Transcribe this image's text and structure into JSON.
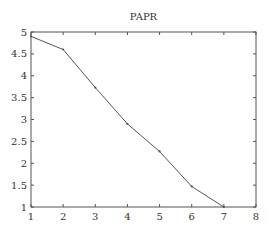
{
  "chart_data": {
    "type": "line",
    "title": "PAPR",
    "xlabel": "",
    "ylabel": "",
    "x": [
      1,
      2,
      3,
      4,
      5,
      6,
      7
    ],
    "series": [
      {
        "name": "PAPR",
        "values": [
          4.9,
          4.6,
          3.73,
          2.9,
          2.27,
          1.47,
          1.0
        ],
        "color": "#555555",
        "marker": "dot"
      }
    ],
    "xlim": [
      1,
      8
    ],
    "ylim": [
      1,
      5
    ],
    "xticks": [
      1,
      2,
      3,
      4,
      5,
      6,
      7,
      8
    ],
    "xtick_labels": [
      "1",
      "2",
      "3",
      "4",
      "5",
      "6",
      "7",
      "8"
    ],
    "yticks": [
      1,
      1.5,
      2,
      2.5,
      3,
      3.5,
      4,
      4.5,
      5
    ],
    "ytick_labels": [
      "1",
      "1.5",
      "2",
      "2.5",
      "3",
      "3.5",
      "4",
      "4.5",
      "5"
    ],
    "grid": false,
    "legend": null,
    "box": true,
    "ticks_direction": "in"
  },
  "layout": {
    "plot": {
      "left": 31,
      "top": 32,
      "right": 256,
      "bottom": 207
    },
    "axis_color": "#555555",
    "text_color": "#333333"
  }
}
